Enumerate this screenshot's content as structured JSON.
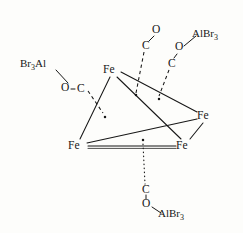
{
  "figure": {
    "kind": "chemical-structure",
    "ink_color": "#171717",
    "background_color": "#fdfdfb"
  },
  "atoms": {
    "metals": [
      {
        "id": "fe-top",
        "label": "Fe",
        "x": 112,
        "y": 70
      },
      {
        "id": "fe-right",
        "label": "Fe",
        "x": 206,
        "y": 116
      },
      {
        "id": "fe-bottom-left",
        "label": "Fe",
        "x": 77,
        "y": 146
      },
      {
        "id": "fe-bottom-right",
        "label": "Fe",
        "x": 185,
        "y": 146
      }
    ],
    "carbonyls": [
      {
        "id": "c-left",
        "label": "C",
        "x": 81,
        "y": 89
      },
      {
        "id": "o-left",
        "label": "O",
        "x": 64,
        "y": 88
      },
      {
        "id": "c-top",
        "label": "C",
        "x": 146,
        "y": 46
      },
      {
        "id": "o-top",
        "label": "O",
        "x": 156,
        "y": 30
      },
      {
        "id": "c-right",
        "label": "C",
        "x": 172,
        "y": 64
      },
      {
        "id": "o-right",
        "label": "O",
        "x": 179,
        "y": 48
      },
      {
        "id": "c-bottom",
        "label": "C",
        "x": 146,
        "y": 190
      },
      {
        "id": "o-bottom",
        "label": "O",
        "x": 146,
        "y": 205
      }
    ]
  },
  "groups": [
    {
      "id": "albr3-left",
      "prefix": "Br",
      "sub1": "3",
      "suffix": "Al",
      "x": 20,
      "y": 64
    },
    {
      "id": "albr3-top",
      "prefix": "AlBr",
      "sub1": "3",
      "suffix": "",
      "x": 192,
      "y": 33
    },
    {
      "id": "albr3-bottom",
      "prefix": "AlBr",
      "sub1": "3",
      "suffix": "",
      "x": 157,
      "y": 205
    }
  ],
  "bridge_dots": [
    {
      "id": "dot-left",
      "x": 104,
      "y": 116
    },
    {
      "id": "dot-top",
      "x": 136,
      "y": 96
    },
    {
      "id": "dot-right",
      "x": 159,
      "y": 99
    },
    {
      "id": "dot-bottom",
      "x": 143,
      "y": 140
    }
  ],
  "bonds": {
    "skeleton_solid": [
      {
        "from": "fe-top",
        "to": "fe-bottom-left"
      },
      {
        "from": "fe-top",
        "to": "fe-bottom-right"
      },
      {
        "from": "fe-top",
        "to": "fe-right"
      },
      {
        "from": "fe-right",
        "to": "fe-bottom-left"
      },
      {
        "from": "fe-right",
        "to": "fe-bottom-right"
      },
      {
        "from": "fe-bottom-left",
        "to": "fe-bottom-right"
      }
    ],
    "dashed_to_bridge": [
      {
        "from": "c-left",
        "to": "dot-left"
      },
      {
        "from": "c-top",
        "to": "dot-top"
      },
      {
        "from": "c-right",
        "to": "dot-right"
      }
    ],
    "dotted_to_bridge": [
      {
        "from": "c-bottom",
        "to": "dot-bottom"
      }
    ],
    "ligand_links": [
      {
        "from": "albr3-left",
        "to": "o-left"
      },
      {
        "from": "o-left",
        "to": "c-left"
      },
      {
        "from": "o-top",
        "to": "c-top"
      },
      {
        "from": "o-right",
        "to": "c-right"
      },
      {
        "from": "o-right",
        "to": "albr3-top"
      },
      {
        "from": "c-bottom",
        "to": "o-bottom"
      },
      {
        "from": "o-bottom",
        "to": "albr3-bottom"
      }
    ]
  }
}
